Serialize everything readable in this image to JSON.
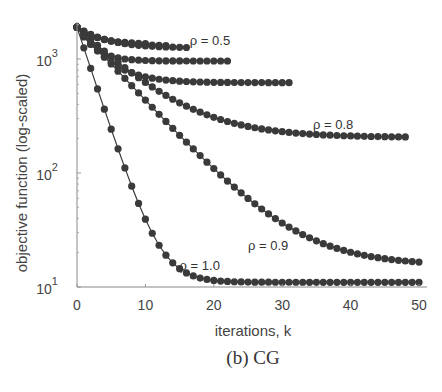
{
  "caption": "(b) CG",
  "chart_data": {
    "type": "line",
    "title": "",
    "xlabel": "iterations, k",
    "ylabel": "objective function (log-scaled)",
    "yscale": "log",
    "xlim": [
      0,
      50
    ],
    "ylim": [
      10,
      2000
    ],
    "xticks": [
      0,
      10,
      20,
      30,
      40,
      50
    ],
    "yticks": [
      {
        "value": 10,
        "label": "10",
        "exp": "1"
      },
      {
        "value": 100,
        "label": "10",
        "exp": "2"
      },
      {
        "value": 1000,
        "label": "10",
        "exp": "3"
      }
    ],
    "grid": false,
    "legend": "none",
    "marker": "filled-circle",
    "color": "#3a3a3a",
    "series": [
      {
        "name": "short-1",
        "start": 1900,
        "floor": 1350,
        "rate": 0.35,
        "n": 10
      },
      {
        "name": "short-2",
        "start": 1900,
        "floor": 1300,
        "rate": 0.3,
        "n": 13
      },
      {
        "name": "rho=0.5",
        "start": 1900,
        "floor": 1250,
        "rate": 0.25,
        "n": 16
      },
      {
        "name": "rho=0.6",
        "start": 1900,
        "floor": 960,
        "rate": 0.45,
        "n": 22
      },
      {
        "name": "rho=0.7",
        "start": 1900,
        "floor": 620,
        "rate": 0.28,
        "n": 31
      },
      {
        "name": "rho=0.8",
        "start": 1900,
        "floor": 205,
        "rate": 0.14,
        "n": 48
      },
      {
        "name": "rho=0.9",
        "start": 1900,
        "floor": 15.5,
        "rate": 0.15,
        "n": 50
      },
      {
        "name": "rho=1.0",
        "start": 1900,
        "floor": 11,
        "rate": 0.42,
        "n": 50
      }
    ],
    "annotations": [
      {
        "text": "ρ = 0.5",
        "x": 16.5,
        "y": 1330
      },
      {
        "text": "ρ = 0.8",
        "x": 34.5,
        "y": 245
      },
      {
        "text": "ρ = 0.9",
        "x": 25,
        "y": 21
      },
      {
        "text": "ρ = 1.0",
        "x": 15,
        "y": 14.2
      }
    ]
  }
}
